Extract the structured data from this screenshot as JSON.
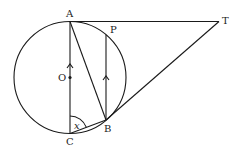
{
  "figure": {
    "type": "geometry-diagram",
    "circle": {
      "center": "O",
      "cx": 70,
      "cy": 77.5,
      "r": 56
    },
    "points": {
      "A": {
        "label": "A",
        "x": 70,
        "y": 21.5
      },
      "C": {
        "label": "C",
        "x": 70,
        "y": 133.5
      },
      "O": {
        "label": "O",
        "x": 70,
        "y": 77.5
      },
      "B": {
        "label": "B",
        "x": 106,
        "y": 120
      },
      "P": {
        "label": "P",
        "x": 106,
        "y": 35
      },
      "T": {
        "label": "T",
        "x": 219,
        "y": 21.5
      }
    },
    "segments": [
      "AT",
      "TB",
      "AC",
      "AB",
      "PB",
      "CB"
    ],
    "parallel_marks": [
      "AC",
      "PB"
    ],
    "angle": {
      "label": "x",
      "vertex": "C",
      "between": [
        "CA",
        "CB"
      ]
    }
  }
}
